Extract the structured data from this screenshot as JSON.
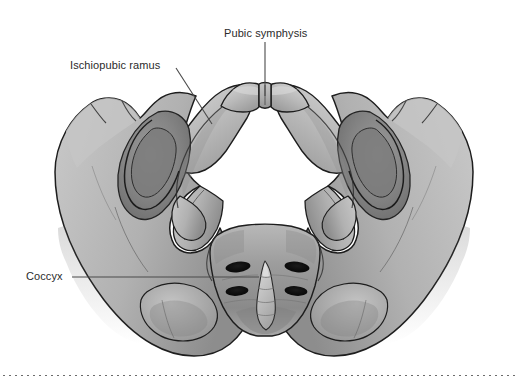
{
  "figure": {
    "view": "Female bony pelvis seen from below / front",
    "background_color": "#ffffff",
    "width_px": 516,
    "height_px": 385
  },
  "palette": {
    "bone_light": "#d2d2d2",
    "bone_mid": "#b4b4b4",
    "bone_dark": "#8e8e8e",
    "bone_shadow": "#6f6f6f",
    "outline": "#1d1d1d",
    "foramen_dark": "#101010",
    "label_text": "#2b2b2b",
    "leader_line": "#4a4a4a",
    "dotted_rule": "#6b6b6b"
  },
  "annotations": [
    {
      "id": "pubic-symphysis",
      "label": "Pubic symphysis",
      "text_x": 224,
      "text_y": 27,
      "leader": {
        "type": "vertical",
        "x1": 265,
        "y1": 42,
        "x2": 265,
        "y2": 96
      }
    },
    {
      "id": "ischiopubic-ramus",
      "label": "Ischiopubic ramus",
      "text_x": 70,
      "text_y": 59,
      "leader": {
        "type": "diagonal",
        "x1": 176,
        "y1": 68,
        "x2": 212,
        "y2": 124
      }
    },
    {
      "id": "coccyx",
      "label": "Coccyx",
      "text_x": 26,
      "text_y": 270,
      "leader": {
        "type": "horizontal",
        "x1": 72,
        "y1": 277,
        "x2": 259,
        "y2": 277
      }
    }
  ],
  "structures": {
    "pubic_symphysis": {
      "center_x": 265,
      "top_y": 83,
      "bottom_y": 107
    },
    "pelvic_opening": {
      "center_x": 265,
      "center_y": 172,
      "rx": 106,
      "ry": 76
    },
    "sacrum": {
      "center_x": 265,
      "top_y": 228,
      "bottom_y": 332
    },
    "coccyx_tip": {
      "center_x": 265,
      "top_y": 262,
      "bottom_y": 333
    },
    "sacral_foramina_count": 4,
    "sacral_foramina": [
      {
        "cx": 238,
        "cy": 267,
        "rx": 12,
        "ry": 5
      },
      {
        "cx": 297,
        "cy": 267,
        "rx": 12,
        "ry": 5
      },
      {
        "cx": 237,
        "cy": 291,
        "rx": 12,
        "ry": 5
      },
      {
        "cx": 296,
        "cy": 291,
        "rx": 12,
        "ry": 5
      }
    ],
    "obturator_foramen_left": {
      "cx": 132,
      "cy": 165
    },
    "obturator_foramen_right": {
      "cx": 396,
      "cy": 165
    },
    "iliac_crest_left_x": 60,
    "iliac_crest_right_x": 468
  },
  "footer_rule": {
    "style": "dotted",
    "y": 375,
    "x_start": 0,
    "x_end": 516
  }
}
